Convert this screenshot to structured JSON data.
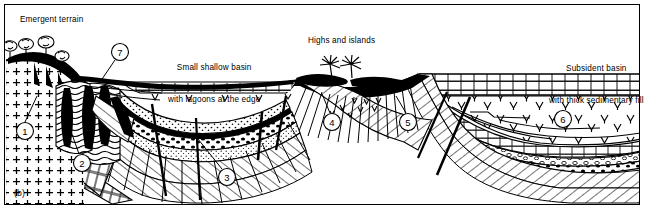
{
  "figure": {
    "panel_label": "(b)",
    "type": "geological cross-section",
    "width": 648,
    "height": 213,
    "background_color": "#ffffff",
    "line_color": "#000000"
  },
  "annotations": {
    "emergent_terrain": "Emergent terrain",
    "small_basin_line1": "Small shallow basin",
    "small_basin_line2": "with lagoons at the edge",
    "highs_islands": "Highs and islands",
    "subsident_line1": "Subsident basin",
    "subsident_line2": "with thick sedimentary fill"
  },
  "callouts": [
    {
      "id": "1",
      "label": "1",
      "cx": 25,
      "cy": 131,
      "r": 8.5,
      "leader": [
        [
          25,
          122
        ],
        [
          37,
          96
        ]
      ]
    },
    {
      "id": "2",
      "label": "2",
      "cx": 82,
      "cy": 163,
      "r": 8.5,
      "leader": [
        [
          79,
          154
        ],
        [
          68,
          123
        ]
      ]
    },
    {
      "id": "3",
      "label": "3",
      "cx": 227,
      "cy": 177,
      "r": 8.5,
      "leader": [
        [
          222,
          169
        ],
        [
          198,
          139
        ]
      ]
    },
    {
      "id": "4",
      "label": "4",
      "cx": 332,
      "cy": 122,
      "r": 8.5,
      "leader": [
        [
          330,
          113
        ],
        [
          322,
          94
        ]
      ]
    },
    {
      "id": "5",
      "label": "5",
      "cx": 408,
      "cy": 122,
      "r": 8.5,
      "leader": [
        [
          406,
          113
        ],
        [
          396,
          96
        ]
      ]
    },
    {
      "id": "6",
      "label": "6",
      "cx": 563,
      "cy": 119,
      "r": 8.5,
      "leader": null
    },
    {
      "id": "7",
      "label": "7",
      "cx": 120,
      "cy": 52,
      "r": 8.5,
      "leader": [
        [
          115,
          60
        ],
        [
          100,
          82
        ]
      ]
    }
  ],
  "features": {
    "basement_crystalline": "plutonic basement (cross symbols)",
    "basement_metamorphic": "schist / metamorphic basement (wavy lines)",
    "dikes": "dark intrusive dikes",
    "limestone": "limestone (brick pattern)",
    "sandstone": "sandstone (stipple)",
    "conglomerate": "conglomerate (pebble dots)",
    "marl_symbols": "marl / evaporite V symbols",
    "faults": "normal faults (heavy lines)",
    "vegetation_left": "trees on emergent terrain",
    "vegetation_highs": "palm trees on islands"
  }
}
